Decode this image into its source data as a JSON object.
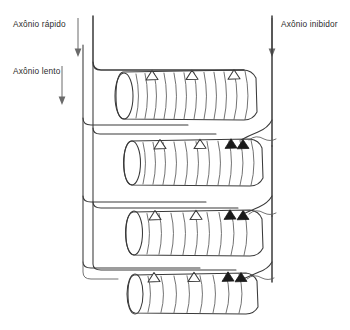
{
  "figure": {
    "background_color": "#ffffff",
    "ink_color": "#3a3a3a",
    "label_color": "#2b2b2b"
  },
  "labels": {
    "fast_axon": "Axônio rápido",
    "slow_axon": "Axônio lento",
    "inhibitory_axon": "Axônio inibidor"
  },
  "axons": [
    {
      "id": "fast",
      "label": "Axônio rápido",
      "type": "excitatory",
      "trunk_x": 93,
      "arrow_x": 78,
      "arrow_y_start": 18,
      "arrow_y_end": 52,
      "innervates_fibers": [
        1,
        2,
        3,
        4
      ]
    },
    {
      "id": "slow",
      "label": "Axônio lento",
      "type": "excitatory",
      "trunk_x": 83,
      "arrow_x": 62,
      "arrow_y_start": 66,
      "arrow_y_end": 100,
      "innervates_fibers": [
        1,
        2,
        3,
        4
      ]
    },
    {
      "id": "inhibitory",
      "label": "Axônio inibidor",
      "type": "inhibitory",
      "trunk_x": 272,
      "arrow_x": 272,
      "arrow_y_start": 18,
      "arrow_y_end": 52,
      "innervates_fibers": [
        2,
        3,
        4
      ]
    }
  ],
  "muscle_fibers": [
    {
      "index": 1,
      "cy": 95,
      "excitatory_synapse_count": 3,
      "inhibitory_synapse_count": 0,
      "striation_count": 13
    },
    {
      "index": 2,
      "cy": 160,
      "excitatory_synapse_count": 2,
      "inhibitory_synapse_count": 1,
      "striation_count": 11
    },
    {
      "index": 3,
      "cy": 231,
      "excitatory_synapse_count": 2,
      "inhibitory_synapse_count": 1,
      "striation_count": 9
    },
    {
      "index": 4,
      "cy": 294,
      "excitatory_synapse_count": 2,
      "inhibitory_synapse_count": 1,
      "striation_count": 8
    }
  ],
  "legend_semantics": {
    "open_triangle": "terminal sináptico excitatório",
    "filled_triangle": "terminal sináptico inibitório"
  }
}
